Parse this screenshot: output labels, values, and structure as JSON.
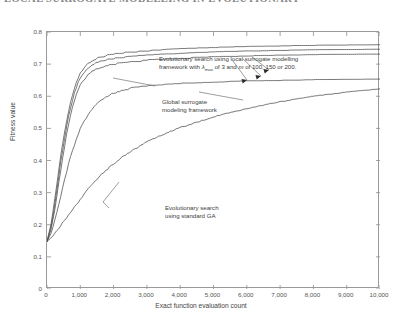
{
  "page": {
    "running_header": "LOCAL SURROGATE MODELLING IN EVOLUTIONARY"
  },
  "chart_data": {
    "type": "line",
    "title": "",
    "xlabel": "Exact function evaluation count",
    "ylabel": "Fitness value",
    "xlim": [
      0,
      10000
    ],
    "ylim": [
      0,
      0.8
    ],
    "grid": false,
    "legend": "none (curves labelled by in-plot annotations with leader lines)",
    "xticks": [
      0,
      1000,
      2000,
      3000,
      4000,
      5000,
      6000,
      7000,
      8000,
      9000,
      10000
    ],
    "xtick_labels": [
      "0",
      "1,000",
      "2,000",
      "3,000",
      "4,000",
      "5,000",
      "6,000",
      "7,000",
      "8,000",
      "9,000",
      "10,000"
    ],
    "yticks": [
      0,
      0.1,
      0.2,
      0.3,
      0.4,
      0.5,
      0.6,
      0.7,
      0.8
    ],
    "ytick_labels": [
      "0",
      "0.1",
      "0.2",
      "0.3",
      "0.4",
      "0.5",
      "0.6",
      "0.7",
      "0.8"
    ],
    "x": [
      0,
      100,
      200,
      300,
      400,
      500,
      600,
      700,
      800,
      900,
      1000,
      1200,
      1400,
      1600,
      1800,
      2000,
      2500,
      3000,
      3500,
      4000,
      5000,
      6000,
      7000,
      8000,
      9000,
      10000
    ],
    "series": [
      {
        "name": "Evolutionary search using local surrogate modelling framework, lambda_max = 3, m = 100",
        "annotation_group": "local-surrogate",
        "values": [
          0.15,
          0.19,
          0.255,
          0.33,
          0.405,
          0.47,
          0.53,
          0.578,
          0.618,
          0.65,
          0.672,
          0.7,
          0.714,
          0.722,
          0.727,
          0.731,
          0.737,
          0.741,
          0.744,
          0.747,
          0.751,
          0.754,
          0.756,
          0.758,
          0.759,
          0.76
        ]
      },
      {
        "name": "Evolutionary search using local surrogate modelling framework, lambda_max = 3, m = 150",
        "annotation_group": "local-surrogate",
        "values": [
          0.15,
          0.183,
          0.24,
          0.312,
          0.386,
          0.452,
          0.512,
          0.562,
          0.602,
          0.634,
          0.658,
          0.686,
          0.7,
          0.708,
          0.713,
          0.717,
          0.723,
          0.727,
          0.73,
          0.733,
          0.737,
          0.74,
          0.742,
          0.744,
          0.745,
          0.746
        ]
      },
      {
        "name": "Evolutionary search using local surrogate modelling framework, lambda_max = 3, m = 200",
        "annotation_group": "local-surrogate",
        "values": [
          0.15,
          0.176,
          0.226,
          0.292,
          0.362,
          0.428,
          0.488,
          0.538,
          0.578,
          0.61,
          0.636,
          0.664,
          0.68,
          0.69,
          0.696,
          0.7,
          0.707,
          0.712,
          0.715,
          0.718,
          0.722,
          0.725,
          0.727,
          0.729,
          0.73,
          0.731
        ]
      },
      {
        "name": "Global surrogate modeling framework",
        "annotation_group": "global-surrogate",
        "values": [
          0.15,
          0.168,
          0.2,
          0.24,
          0.284,
          0.328,
          0.37,
          0.408,
          0.442,
          0.472,
          0.498,
          0.538,
          0.566,
          0.586,
          0.6,
          0.61,
          0.625,
          0.632,
          0.636,
          0.639,
          0.644,
          0.647,
          0.649,
          0.651,
          0.652,
          0.653
        ]
      },
      {
        "name": "Evolutionary search using standard GA",
        "annotation_group": "standard-ga",
        "values": [
          0.15,
          0.158,
          0.17,
          0.182,
          0.196,
          0.21,
          0.224,
          0.238,
          0.252,
          0.266,
          0.28,
          0.306,
          0.33,
          0.352,
          0.372,
          0.39,
          0.428,
          0.458,
          0.482,
          0.502,
          0.536,
          0.562,
          0.583,
          0.6,
          0.613,
          0.623
        ]
      }
    ],
    "annotations": [
      {
        "id": "local-surrogate",
        "line1": "Evolutionary search using local surrogate modelling",
        "line2_pre": "framework with  ",
        "line2_lambda": "λ",
        "line2_sub": "max",
        "line2_mid": " of 3 and ",
        "line2_m": "m",
        "line2_post": " of 100, 150 or 200.",
        "text_plain": "Evolutionary search using local surrogate modelling framework with λmax of 3 and m of 100, 150 or 200.",
        "points_to": "three upper curves near x=6,200–7,000"
      },
      {
        "id": "global-surrogate",
        "line1": "Global surrogate",
        "line2": "modeling framework",
        "text_plain": "Global surrogate modeling framework",
        "points_to": "fourth curve, leader lines to upper-left and lower-right"
      },
      {
        "id": "standard-ga",
        "line1": "Evolutionary search",
        "line2": "using standard GA",
        "text_plain": "Evolutionary search using standard GA",
        "points_to": "lowest curve via leader line to the left"
      }
    ]
  }
}
